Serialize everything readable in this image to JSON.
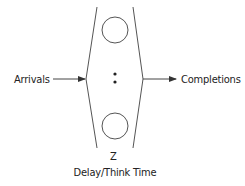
{
  "diagram": {
    "type": "delay-center-queueing-model",
    "input_label": "Arrivals",
    "output_label": "Completions",
    "symbol": "Z",
    "caption": "Delay/Think Time",
    "servers": {
      "drawn_count": 2,
      "ellipsis": "vertical-dots"
    },
    "colors": {
      "stroke": "#555555",
      "text": "#222222",
      "background": "#ffffff"
    }
  }
}
